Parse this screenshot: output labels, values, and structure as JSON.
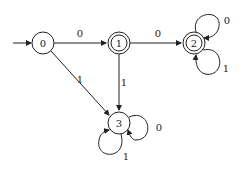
{
  "diagram": {
    "type": "dfa",
    "states": [
      {
        "id": "0",
        "label": "0",
        "initial": true,
        "accepting": false
      },
      {
        "id": "1",
        "label": "1",
        "initial": false,
        "accepting": true
      },
      {
        "id": "2",
        "label": "2",
        "initial": false,
        "accepting": true
      },
      {
        "id": "3",
        "label": "3",
        "initial": false,
        "accepting": false
      }
    ],
    "transitions": [
      {
        "from": "0",
        "to": "1",
        "label": "0"
      },
      {
        "from": "1",
        "to": "2",
        "label": "0"
      },
      {
        "from": "0",
        "to": "3",
        "label": "1"
      },
      {
        "from": "1",
        "to": "3",
        "label": "1"
      },
      {
        "from": "2",
        "to": "2",
        "label": "0"
      },
      {
        "from": "2",
        "to": "2",
        "label": "1"
      },
      {
        "from": "3",
        "to": "3",
        "label": "0"
      },
      {
        "from": "3",
        "to": "3",
        "label": "1"
      }
    ],
    "colors": {
      "stroke": "#222222",
      "background": "#ffffff"
    }
  }
}
